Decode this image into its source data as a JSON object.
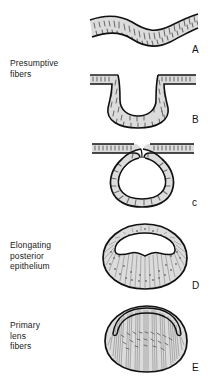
{
  "figure": {
    "background_color": "#ffffff",
    "width": 215,
    "height": 392,
    "ink_color": "#111111",
    "tissue_fill": "#d7d7d7",
    "tissue_fill_light": "#e4e4e4",
    "nuclei_color": "#6b6b6b",
    "fiber_color": "#9a9a9a"
  },
  "labels": [
    {
      "name": "presumptive-fibers",
      "text": "Presumptive\nfibers",
      "top": 58
    },
    {
      "name": "elongating-posterior-epithelium",
      "text": "Elongating\nposterior\nepithelium",
      "top": 240
    },
    {
      "name": "primary-lens-fibers",
      "text": "Primary\nlens\nfibers",
      "top": 320
    }
  ],
  "stages": [
    {
      "id": "A",
      "letter": "A",
      "name": "stage-a-lens-placode",
      "description": "Flattened wavy lens placode epithelium with columnar cells",
      "letter_left": 192,
      "letter_top": 44
    },
    {
      "id": "B",
      "letter": "B",
      "name": "stage-b-lens-pit",
      "description": "Invaginating lens pit forming a U-shaped cup",
      "letter_left": 192,
      "letter_top": 114
    },
    {
      "id": "C",
      "letter": "c",
      "name": "stage-c-lens-vesicle",
      "description": "Closing lens vesicle with narrow central lumen",
      "letter_left": 192,
      "letter_top": 197
    },
    {
      "id": "D",
      "letter": "D",
      "name": "stage-d-elongating-posterior-epithelium",
      "description": "Lens vesicle with elongating posterior epithelial cells reducing the lumen",
      "letter_left": 192,
      "letter_top": 280
    },
    {
      "id": "E",
      "letter": "E",
      "name": "stage-e-primary-lens-fibers",
      "description": "Lens filled with primary lens fibers beneath the anterior epithelium",
      "letter_left": 192,
      "letter_top": 362
    }
  ]
}
